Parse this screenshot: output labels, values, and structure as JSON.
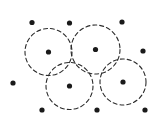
{
  "figure": {
    "type": "geometric-point-diagram",
    "width": 164,
    "height": 126,
    "background_color": "#ffffff",
    "stroke_color": "#2b2b2b",
    "dot_color": "#1a1a1a",
    "stroke_width": 1.1,
    "dash_pattern": "4 3",
    "dot_radius": 2.6,
    "circles": [
      {
        "label": "circle-top-left",
        "cx": 48.5,
        "cy": 52.0,
        "r": 23.5
      },
      {
        "label": "circle-top-right",
        "cx": 95.5,
        "cy": 49.5,
        "r": 24.5
      },
      {
        "label": "circle-bottom-left",
        "cx": 69.5,
        "cy": 86.0,
        "r": 23.5
      },
      {
        "label": "circle-bottom-right",
        "cx": 123.0,
        "cy": 82.0,
        "r": 23.0
      }
    ],
    "circle_center_dots": [
      {
        "label": "center-dot-top-left",
        "cx": 48.5,
        "cy": 52.0
      },
      {
        "label": "center-dot-top-right",
        "cx": 95.5,
        "cy": 49.5
      },
      {
        "label": "center-dot-bottom-left",
        "cx": 69.5,
        "cy": 86.0
      },
      {
        "label": "center-dot-bottom-right",
        "cx": 123.0,
        "cy": 82.0
      }
    ],
    "outer_dots": [
      {
        "label": "dot-top-1",
        "cx": 32.0,
        "cy": 22.5
      },
      {
        "label": "dot-top-2",
        "cx": 69.5,
        "cy": 23.0
      },
      {
        "label": "dot-top-3",
        "cx": 122.0,
        "cy": 22.0
      },
      {
        "label": "dot-right-1",
        "cx": 143.0,
        "cy": 51.0
      },
      {
        "label": "dot-left-1",
        "cx": 13.0,
        "cy": 83.0
      },
      {
        "label": "dot-bottom-1",
        "cx": 42.0,
        "cy": 110.0
      },
      {
        "label": "dot-bottom-2",
        "cx": 97.0,
        "cy": 110.0
      },
      {
        "label": "dot-bottom-3",
        "cx": 145.0,
        "cy": 110.0
      }
    ],
    "counts": {
      "circle_count": 4,
      "outer_dot_count": 8,
      "total_dot_count": 12
    }
  }
}
